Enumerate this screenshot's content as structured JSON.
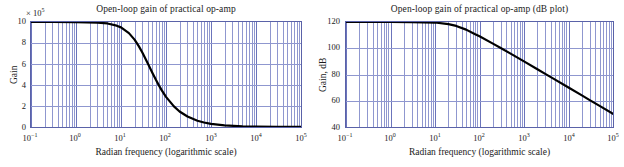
{
  "figure": {
    "caption": "Open-loop gain of a practical op-amp shown on linear and dB vertical scales versus logarithmic radian frequency."
  },
  "charts": [
    {
      "id": "linear-gain-plot",
      "title": "Open-loop gain of practical op-amp",
      "y_multiplier_prefix": "× 10",
      "y_multiplier_exponent": "5",
      "ylabel": "Gain",
      "xlabel": "Radian frequency (logarithmic scale)",
      "yticks": [
        "10",
        "8",
        "6",
        "4",
        "2",
        "0"
      ],
      "xticks": [
        {
          "mantissa": "10",
          "exponent": "−1"
        },
        {
          "mantissa": "10",
          "exponent": "0"
        },
        {
          "mantissa": "10",
          "exponent": "1"
        },
        {
          "mantissa": "10",
          "exponent": "2"
        },
        {
          "mantissa": "10",
          "exponent": "3"
        },
        {
          "mantissa": "10",
          "exponent": "4"
        },
        {
          "mantissa": "10",
          "exponent": "5"
        }
      ]
    },
    {
      "id": "db-gain-plot",
      "title": "Open-loop gain of practical op-amp (dB plot)",
      "y_multiplier_prefix": "",
      "y_multiplier_exponent": "",
      "ylabel": "Gain, dB",
      "xlabel": "Radian frequency (logarithmic scale)",
      "yticks": [
        "120",
        "100",
        "80",
        "60",
        "40"
      ],
      "xticks": [
        {
          "mantissa": "10",
          "exponent": "−1"
        },
        {
          "mantissa": "10",
          "exponent": "0"
        },
        {
          "mantissa": "10",
          "exponent": "1"
        },
        {
          "mantissa": "10",
          "exponent": "2"
        },
        {
          "mantissa": "10",
          "exponent": "3"
        },
        {
          "mantissa": "10",
          "exponent": "4"
        },
        {
          "mantissa": "10",
          "exponent": "5"
        }
      ]
    }
  ],
  "colors": {
    "grid_minor": "#8f97cf",
    "grid_major": "#6b74bb",
    "axis_border": "#5a62a8",
    "curve": "#000000",
    "background": "#ffffff",
    "text": "#1a1a1a"
  },
  "chart_data": [
    {
      "type": "line",
      "id": "linear-gain-plot",
      "title": "Open-loop gain of practical op-amp",
      "xlabel": "Radian frequency (logarithmic scale)",
      "ylabel": "Gain",
      "y_multiplier": 100000,
      "y_multiplier_label": "× 10⁵",
      "xscale": "log",
      "yscale": "linear",
      "xlim": [
        0.1,
        100000
      ],
      "ylim": [
        0,
        10
      ],
      "xticks": [
        0.1,
        1,
        10,
        100,
        1000,
        10000,
        100000
      ],
      "xticklabels": [
        "10⁻¹",
        "10⁰",
        "10¹",
        "10²",
        "10³",
        "10⁴",
        "10⁵"
      ],
      "yticks": [
        0,
        2,
        4,
        6,
        8,
        10
      ],
      "yticklabels": [
        "0",
        "2",
        "4",
        "6",
        "8",
        "10"
      ],
      "grid": true,
      "grid_minor": true,
      "legend": false,
      "model": "A(w) = A0 / sqrt(1 + (w/wc)^2)",
      "A0_displayed_units": 10,
      "corner_frequency_rad_per_s": 30,
      "series": [
        {
          "name": "Open-loop gain",
          "color": "#000000",
          "linewidth": 2.2,
          "x": [
            0.1,
            0.3,
            1,
            3,
            5,
            8,
            10,
            15,
            20,
            25,
            30,
            40,
            50,
            60,
            70,
            80,
            100,
            150,
            200,
            300,
            500,
            700,
            1000,
            2000,
            5000,
            10000,
            30000,
            100000
          ],
          "y": [
            10.0,
            10.0,
            9.99,
            9.95,
            9.86,
            9.65,
            9.49,
            8.94,
            8.32,
            7.68,
            7.07,
            6.0,
            5.14,
            4.47,
            3.94,
            3.51,
            2.87,
            1.96,
            1.48,
            1.0,
            0.6,
            0.43,
            0.3,
            0.15,
            0.06,
            0.03,
            0.01,
            0.003
          ]
        }
      ]
    },
    {
      "type": "line",
      "id": "db-gain-plot",
      "title": "Open-loop gain of practical op-amp (dB plot)",
      "xlabel": "Radian frequency (logarithmic scale)",
      "ylabel": "Gain, dB",
      "xscale": "log",
      "yscale": "linear",
      "xlim": [
        0.1,
        100000
      ],
      "ylim": [
        40,
        120
      ],
      "xticks": [
        0.1,
        1,
        10,
        100,
        1000,
        10000,
        100000
      ],
      "xticklabels": [
        "10⁻¹",
        "10⁰",
        "10¹",
        "10²",
        "10³",
        "10⁴",
        "10⁵"
      ],
      "yticks": [
        40,
        60,
        80,
        100,
        120
      ],
      "yticklabels": [
        "40",
        "60",
        "80",
        "100",
        "120"
      ],
      "grid": true,
      "grid_minor": true,
      "legend": false,
      "model": "GdB(w) = 20*log10(A0) - 10*log10(1 + (w/wc)^2)",
      "A0_dB": 120,
      "corner_frequency_rad_per_s": 30,
      "rolloff_dB_per_decade": -20,
      "series": [
        {
          "name": "Open-loop gain (dB)",
          "color": "#000000",
          "linewidth": 2.2,
          "x": [
            0.1,
            0.3,
            1,
            3,
            10,
            20,
            30,
            50,
            80,
            100,
            200,
            300,
            500,
            1000,
            2000,
            3000,
            5000,
            10000,
            20000,
            30000,
            50000,
            100000
          ],
          "y": [
            120.0,
            120.0,
            120.0,
            119.9,
            119.6,
            118.4,
            117.0,
            114.2,
            110.6,
            109.1,
            103.5,
            100.2,
            95.9,
            90.0,
            84.0,
            80.5,
            76.1,
            70.1,
            64.1,
            60.5,
            56.1,
            50.1
          ]
        }
      ]
    }
  ]
}
